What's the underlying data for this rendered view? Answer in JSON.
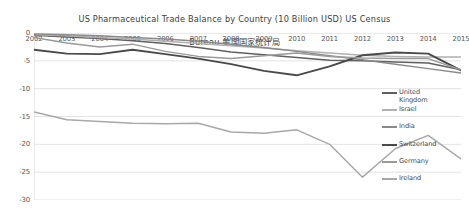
{
  "title": {
    "line1": "US Pharmaceutical Trade Balance by Country (10 Billion USD) US Census",
    "line2": "Bureau 美国国家统计局"
  },
  "chart_data": {
    "type": "line",
    "title": "US Pharmaceutical Trade Balance by Country (10 Billion USD) US Census Bureau 美国国家统计局",
    "xlabel": "",
    "ylabel": "",
    "x": [
      2002,
      2003,
      2004,
      2005,
      2006,
      2007,
      2008,
      2009,
      2010,
      2011,
      2012,
      2013,
      2014,
      2015
    ],
    "xtick_labels": [
      "2002",
      "2003",
      "2004",
      "2005",
      "2006",
      "2007",
      "2008",
      "2009",
      "2010",
      "2011",
      "2012",
      "2013",
      "2014",
      "2015"
    ],
    "ytick_labels": [
      "0",
      "-5",
      "-10",
      "-15",
      "-20",
      "-25",
      "-30"
    ],
    "ytick_values": [
      0,
      -5,
      -10,
      -15,
      -20,
      -25,
      -30
    ],
    "ylim": [
      -30,
      0
    ],
    "xlim": [
      2002,
      2015
    ],
    "grid": true,
    "grid_axis": "y",
    "legend_position": "right-inside",
    "series": [
      {
        "name": "United Kingdom",
        "color": "#606060",
        "values": [
          -0.4,
          -0.7,
          -1.0,
          -1.4,
          -1.9,
          -2.6,
          -3.4,
          -3.9,
          -4.4,
          -4.9,
          -5.0,
          -5.2,
          -5.4,
          -6.6
        ]
      },
      {
        "name": "Israel",
        "color": "#b0b0b0",
        "values": [
          -0.3,
          -0.5,
          -0.8,
          -1.1,
          -1.5,
          -1.9,
          -2.3,
          -2.7,
          -3.2,
          -3.6,
          -4.0,
          -4.2,
          -4.3,
          -4.3
        ]
      },
      {
        "name": "India",
        "color": "#8a8a8a",
        "values": [
          -0.2,
          -0.3,
          -0.5,
          -0.8,
          -1.1,
          -1.5,
          -2.0,
          -2.6,
          -3.3,
          -4.1,
          -4.8,
          -5.6,
          -6.4,
          -7.2
        ]
      },
      {
        "name": "Switzerland",
        "color": "#4a4a4a",
        "values": [
          -3.0,
          -3.7,
          -3.8,
          -3.0,
          -3.8,
          -4.6,
          -5.6,
          -6.8,
          -7.6,
          -6.0,
          -4.0,
          -3.5,
          -3.7,
          -6.7
        ]
      },
      {
        "name": "Germany",
        "color": "#9a9a9a",
        "values": [
          -0.8,
          -1.8,
          -2.5,
          -2.0,
          -3.3,
          -4.2,
          -4.6,
          -4.1,
          -3.6,
          -4.2,
          -4.5,
          -4.6,
          -4.6,
          -6.6
        ]
      },
      {
        "name": "Ireland",
        "color": "#a8a8a8",
        "values": [
          -14.2,
          -15.6,
          -15.9,
          -16.2,
          -16.3,
          -16.2,
          -17.8,
          -18.0,
          -17.4,
          -20.0,
          -25.9,
          -20.8,
          -18.4,
          -22.6
        ]
      }
    ]
  },
  "legend": {
    "items": [
      {
        "label": "United\nKingdom",
        "color": "#606060"
      },
      {
        "label": "Israel",
        "color": "#b0b0b0"
      },
      {
        "label": "India",
        "color": "#8a8a8a"
      },
      {
        "label": "Switzerland",
        "color": "#4a4a4a"
      },
      {
        "label": "Germany",
        "color": "#9a9a9a"
      },
      {
        "label": "Ireland",
        "color": "#a8a8a8"
      }
    ]
  }
}
